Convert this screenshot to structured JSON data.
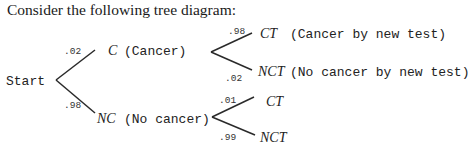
{
  "intro_text": "Consider the following tree diagram:",
  "tree": {
    "root": "Start",
    "level1": [
      {
        "prob": ".02",
        "symbol": "C",
        "desc": "(Cancer)"
      },
      {
        "prob": ".98",
        "symbol": "NC",
        "desc": "(No cancer)"
      }
    ],
    "level2_cancer": [
      {
        "prob": ".98",
        "symbol": "CT",
        "desc": "(Cancer by new test)"
      },
      {
        "prob": ".02",
        "symbol": "NCT",
        "desc": "(No cancer by new test)"
      }
    ],
    "level2_no_cancer": [
      {
        "prob": ".01",
        "symbol": "CT",
        "desc": ""
      },
      {
        "prob": ".99",
        "symbol": "NCT",
        "desc": ""
      }
    ]
  }
}
